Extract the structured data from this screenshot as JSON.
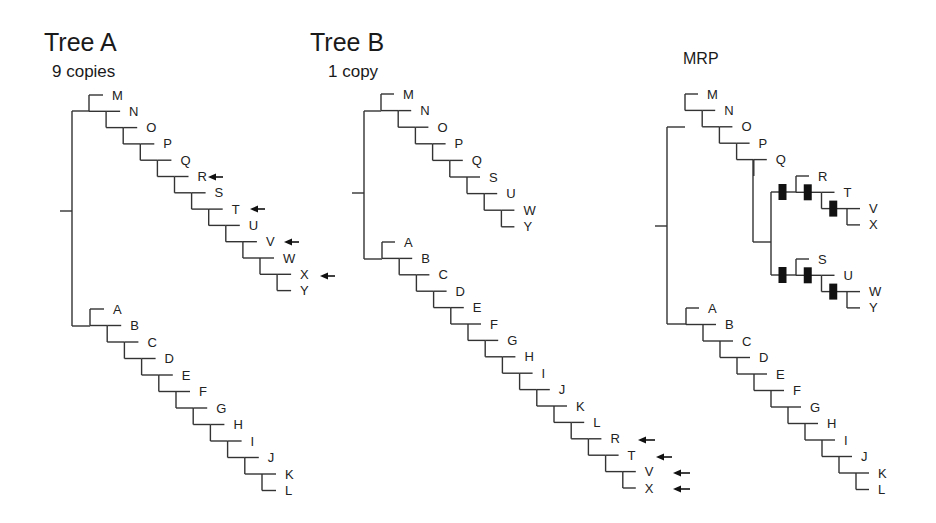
{
  "figure": {
    "width": 936,
    "height": 523,
    "colors": {
      "branch": "#333333",
      "text": "#222222",
      "arrow": "#111111",
      "bar": "#111111",
      "background": "#ffffff"
    }
  },
  "trees": [
    {
      "id": "tree-a",
      "title": "Tree A",
      "subtitle": "9 copies",
      "title_pos": [
        44,
        51
      ],
      "subtitle_pos": [
        52,
        77
      ],
      "root_tick": {
        "x1": 60,
        "x2": 72,
        "y": 211
      },
      "root_vertical": {
        "x": 72,
        "y1": 111,
        "y2": 326
      },
      "ladders": [
        {
          "name": "upper-clade",
          "start_x": 89,
          "step_x": 17.1,
          "start_y": 95,
          "step_y": 16.3,
          "join_y": 111,
          "tip_len": 14,
          "taxa": [
            "M",
            "N",
            "O",
            "P",
            "Q",
            "R",
            "S",
            "T",
            "U",
            "V",
            "W",
            "X",
            "Y"
          ]
        },
        {
          "name": "lower-clade",
          "start_x": 90,
          "step_x": 17.2,
          "start_y": 309,
          "step_y": 16.5,
          "join_y": 326,
          "tip_len": 14,
          "taxa": [
            "A",
            "B",
            "C",
            "D",
            "E",
            "F",
            "G",
            "H",
            "I",
            "J",
            "K",
            "L"
          ]
        }
      ],
      "arrows": [
        {
          "taxon": "R",
          "x1": 208,
          "x2": 223,
          "y": 177
        },
        {
          "taxon": "T",
          "x1": 250,
          "x2": 265,
          "y": 209
        },
        {
          "taxon": "V",
          "x1": 284,
          "x2": 299,
          "y": 242
        },
        {
          "taxon": "X",
          "x1": 320,
          "x2": 335,
          "y": 276
        }
      ]
    },
    {
      "id": "tree-b",
      "title": "Tree B",
      "subtitle": "1 copy",
      "title_pos": [
        310,
        51
      ],
      "subtitle_pos": [
        328,
        77
      ],
      "root_tick": {
        "x1": 352,
        "x2": 364,
        "y": 193
      },
      "root_vertical": {
        "x": 364,
        "y1": 111,
        "y2": 259
      },
      "ladders": [
        {
          "name": "upper-clade",
          "start_x": 381,
          "step_x": 17.2,
          "start_y": 94,
          "step_y": 16.6,
          "join_y": 111,
          "tip_len": 13,
          "taxa": [
            "M",
            "N",
            "O",
            "P",
            "Q",
            "S",
            "U",
            "W",
            "Y"
          ]
        },
        {
          "name": "lower-clade",
          "start_x": 382,
          "step_x": 17.2,
          "start_y": 242,
          "step_y": 16.4,
          "join_y": 259,
          "tip_len": 13,
          "taxa": [
            "A",
            "B",
            "C",
            "D",
            "E",
            "F",
            "G",
            "H",
            "I",
            "J",
            "K",
            "L",
            "R",
            "T",
            "V",
            "X"
          ]
        }
      ],
      "arrows": [
        {
          "taxon": "R",
          "x1": 638,
          "x2": 655,
          "y": 440
        },
        {
          "taxon": "T",
          "x1": 656,
          "x2": 672,
          "y": 457
        },
        {
          "taxon": "V",
          "x1": 673,
          "x2": 690,
          "y": 473
        },
        {
          "taxon": "X",
          "x1": 673,
          "x2": 690,
          "y": 489
        }
      ]
    },
    {
      "id": "tree-mrp",
      "title": "MRP",
      "subtitle": "",
      "title_pos": [
        683,
        64
      ],
      "subtitle_pos": [
        0,
        0
      ],
      "root_tick": {
        "x1": 655,
        "x2": 667,
        "y": 226
      },
      "root_vertical": {
        "x": 667,
        "y1": 127,
        "y2": 324
      },
      "ladders": [
        {
          "name": "upper-backbone",
          "start_x": 685,
          "step_x": 17.2,
          "start_y": 94,
          "step_y": 16.4,
          "join_y": 127,
          "tip_len": 13,
          "taxa": [
            "M",
            "N",
            "O",
            "P",
            "Q"
          ],
          "open_end": true
        },
        {
          "name": "lower-clade",
          "start_x": 686,
          "step_x": 17.0,
          "start_y": 308,
          "step_y": 16.5,
          "join_y": 324,
          "tip_len": 13,
          "taxa": [
            "A",
            "B",
            "C",
            "D",
            "E",
            "F",
            "G",
            "H",
            "I",
            "J",
            "K",
            "L"
          ]
        }
      ],
      "polytomy": {
        "q_node": {
          "x": 753,
          "y_top": 160,
          "y_bottom": 242
        },
        "split_vertical": {
          "x": 771,
          "y1": 192,
          "y2": 275
        },
        "subclades": [
          {
            "name": "RTVX",
            "start_x": 796,
            "step_x": 25.5,
            "start_y": 176,
            "step_y": 16.3,
            "tip_len": 13,
            "taxa": [
              "R",
              "T",
              "V",
              "X"
            ],
            "node_y": 192
          },
          {
            "name": "SUWY",
            "start_x": 796,
            "step_x": 25.5,
            "start_y": 259,
            "step_y": 16.3,
            "tip_len": 13,
            "taxa": [
              "S",
              "U",
              "W",
              "Y"
            ],
            "node_y": 275
          }
        ],
        "bar_size": [
          8,
          16
        ]
      },
      "arrows": []
    }
  ]
}
